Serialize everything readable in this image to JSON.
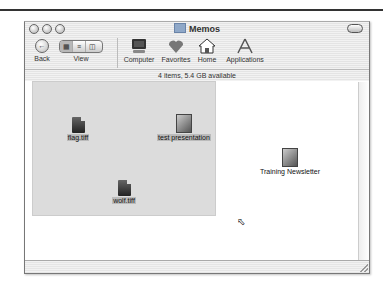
{
  "window": {
    "title": "Memos",
    "status": "4 items, 5.4 GB available"
  },
  "toolbar": {
    "back_label": "Back",
    "view_label": "View",
    "view_modes": [
      "icon",
      "list",
      "column"
    ],
    "items": [
      {
        "label": "Computer",
        "icon": "computer-icon"
      },
      {
        "label": "Favorites",
        "icon": "heart-icon"
      },
      {
        "label": "Home",
        "icon": "house-icon"
      },
      {
        "label": "Applications",
        "icon": "applications-icon"
      }
    ]
  },
  "files": [
    {
      "name": "flag.tiff",
      "selected": true
    },
    {
      "name": "test presentation",
      "selected": true
    },
    {
      "name": "wolf.tiff",
      "selected": true
    },
    {
      "name": "Training Newsletter",
      "selected": false
    }
  ]
}
